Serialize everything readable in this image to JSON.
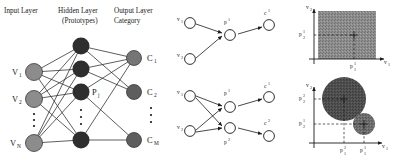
{
  "figure": {
    "caption": "",
    "panels": [
      "rbf-network-architecture",
      "prototype-graph-single",
      "prototype-graph-double",
      "feature-space-single-prototype",
      "feature-space-two-prototypes"
    ]
  },
  "network": {
    "headers": {
      "input": "Input Layer",
      "hidden_line1": "Hidden Layer",
      "hidden_line2": "(Prototypes)",
      "output_line1": "Output Layer",
      "output_line2": "Category"
    },
    "input_nodes": [
      {
        "label": "V",
        "sub": "1"
      },
      {
        "label": "V",
        "sub": "2"
      },
      {
        "label": "V",
        "sub": "N"
      }
    ],
    "hidden_label": {
      "label": "P",
      "sub": "j"
    },
    "hidden_node_count": 4,
    "output_nodes": [
      {
        "label": "C",
        "sub": "1"
      },
      {
        "label": "C",
        "sub": "2"
      },
      {
        "label": "C",
        "sub": "M"
      }
    ],
    "vertical_ellipsis": "⋮",
    "colors": {
      "input_node": "#8c8c8c",
      "hidden_node": "#2e2e2e",
      "output_node": "#6e6e6e",
      "edge": "#2a2a2a"
    }
  },
  "graph_single": {
    "inputs": [
      {
        "label": "v",
        "sub": "1"
      },
      {
        "label": "v",
        "sub": "2"
      }
    ],
    "prototype": {
      "label": "p",
      "sup": "1"
    },
    "output": {
      "label": "c",
      "sup": "1"
    }
  },
  "graph_double": {
    "inputs": [
      {
        "label": "v",
        "sub": "1"
      },
      {
        "label": "v",
        "sub": "2"
      }
    ],
    "prototypes": [
      {
        "label": "p",
        "sup": "1"
      },
      {
        "label": "p",
        "sup": "2"
      }
    ],
    "outputs": [
      {
        "label": "c",
        "sup": "1"
      },
      {
        "label": "c",
        "sup": "2"
      }
    ]
  },
  "space_single": {
    "y_axis": {
      "label": "v",
      "sub": "2"
    },
    "x_axis": {
      "label": "v",
      "sub": "1"
    },
    "y_tick": {
      "label": "p",
      "sup": "1",
      "sub": "2"
    },
    "x_tick": {
      "label": "p",
      "sup": "1",
      "sub": "1"
    },
    "region": "filled-square",
    "fill_color": "#8a8a8a",
    "marker": "plus"
  },
  "space_double": {
    "y_axis": {
      "label": "v",
      "sub": "2"
    },
    "x_axis": {
      "label": "v",
      "sub": "1"
    },
    "y_ticks": [
      {
        "label": "p",
        "sup": "2",
        "sub": "2"
      },
      {
        "label": "p",
        "sup": "1",
        "sub": "2"
      }
    ],
    "x_ticks": [
      {
        "label": "p",
        "sup": "2",
        "sub": "1"
      },
      {
        "label": "p",
        "sup": "1",
        "sub": "1"
      }
    ],
    "circles": [
      {
        "name": "prototype-2-region",
        "radius_rel": "large",
        "fill_color": "#4d4d4d"
      },
      {
        "name": "prototype-1-region",
        "radius_rel": "small",
        "fill_color": "#6b6b6b"
      }
    ],
    "marker": "plus"
  }
}
